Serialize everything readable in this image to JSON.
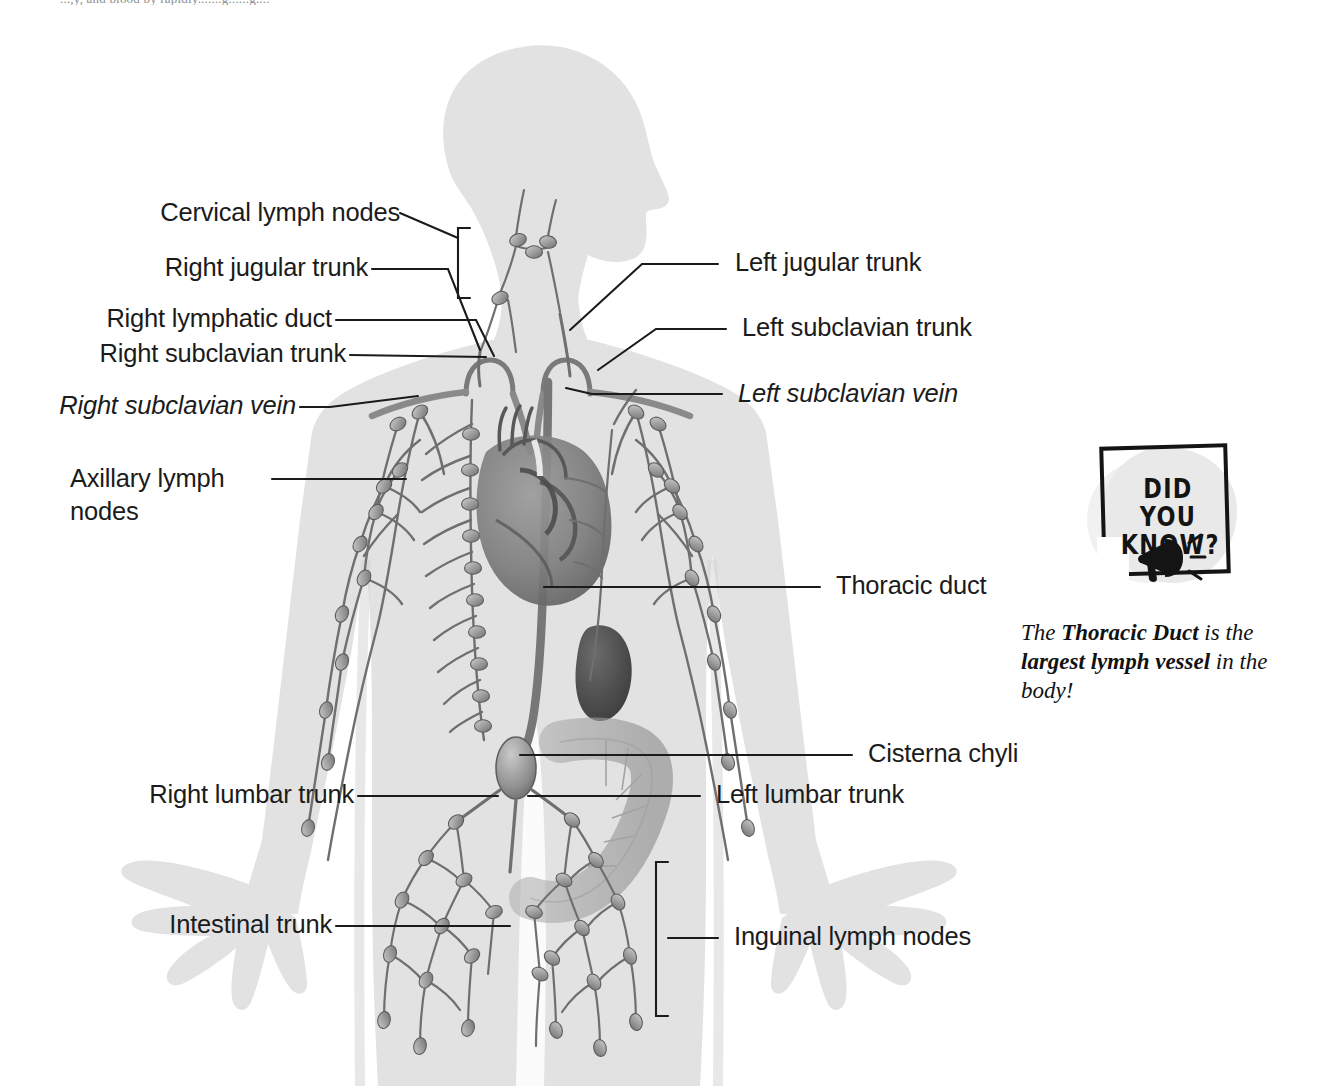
{
  "page": {
    "running_head": "...,y, and blood by rapidly.......g......g....",
    "background_color": "#ffffff",
    "silhouette_color": "#e2e2e2",
    "vessel_color": "#6f6f6f",
    "leader_color": "#1b1b1b",
    "text_color": "#1b1b1b"
  },
  "figure": {
    "labels": [
      {
        "id": "cervical-lymph-nodes",
        "text": "Cervical lymph nodes",
        "side": "left",
        "italic": false,
        "multiline": false
      },
      {
        "id": "right-jugular-trunk",
        "text": "Right jugular trunk",
        "side": "left",
        "italic": false,
        "multiline": false
      },
      {
        "id": "right-lymphatic-duct",
        "text": "Right lymphatic duct",
        "side": "left",
        "italic": false,
        "multiline": false
      },
      {
        "id": "right-subclavian-trunk",
        "text": "Right subclavian trunk",
        "side": "left",
        "italic": false,
        "multiline": false
      },
      {
        "id": "right-subclavian-vein",
        "text": "Right subclavian vein",
        "side": "left",
        "italic": true,
        "multiline": false
      },
      {
        "id": "axillary-lymph-nodes",
        "text": "Axillary lymph\nnodes",
        "side": "left",
        "italic": false,
        "multiline": true
      },
      {
        "id": "right-lumbar-trunk",
        "text": "Right lumbar trunk",
        "side": "left",
        "italic": false,
        "multiline": false
      },
      {
        "id": "intestinal-trunk",
        "text": "Intestinal trunk",
        "side": "left",
        "italic": false,
        "multiline": false
      },
      {
        "id": "left-jugular-trunk",
        "text": "Left jugular trunk",
        "side": "right",
        "italic": false,
        "multiline": false
      },
      {
        "id": "left-subclavian-trunk",
        "text": "Left subclavian trunk",
        "side": "right",
        "italic": false,
        "multiline": false
      },
      {
        "id": "left-subclavian-vein",
        "text": "Left subclavian vein",
        "side": "right",
        "italic": true,
        "multiline": false
      },
      {
        "id": "thoracic-duct",
        "text": "Thoracic duct",
        "side": "right",
        "italic": false,
        "multiline": false
      },
      {
        "id": "cisterna-chyli",
        "text": "Cisterna chyli",
        "side": "right",
        "italic": false,
        "multiline": false
      },
      {
        "id": "left-lumbar-trunk",
        "text": "Left lumbar trunk",
        "side": "right",
        "italic": false,
        "multiline": false
      },
      {
        "id": "inguinal-lymph-nodes",
        "text": "Inguinal lymph nodes",
        "side": "right",
        "italic": false,
        "multiline": false
      }
    ]
  },
  "did_you_know": {
    "badge_line1": "DID YOU",
    "badge_line2": "KNOW?",
    "icon": "megaphone-icon",
    "caption_prefix": "The ",
    "caption_bold1": "Thoracic Duct",
    "caption_mid": " is the ",
    "caption_bold2": "largest lymph vessel",
    "caption_suffix": " in the body!"
  }
}
